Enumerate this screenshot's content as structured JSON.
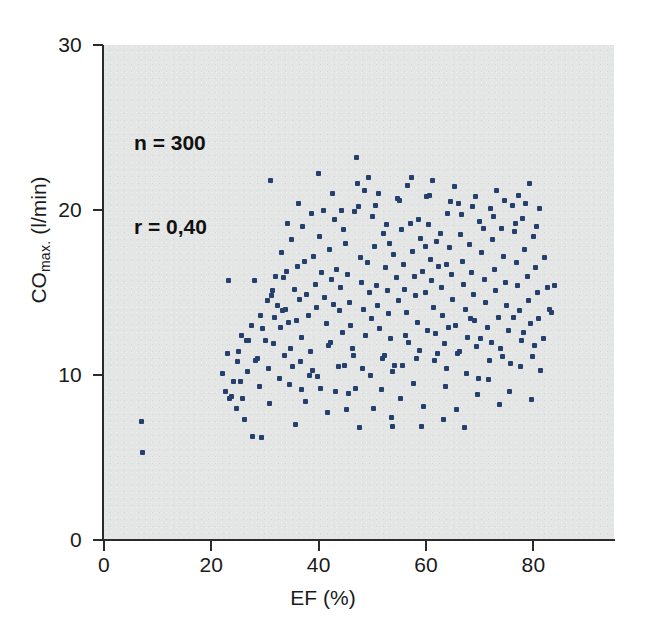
{
  "figure": {
    "background_color": "#ffffff",
    "plot_background_color": "#e3e6e5",
    "axis_color": "#2b2b2b",
    "marker_color": "#26406e"
  },
  "annotation": {
    "n_label": "n = 300",
    "r_label": "r = 0,40"
  },
  "chart_data": {
    "type": "scatter",
    "title": "",
    "xlabel": "EF (%)",
    "ylabel_main": "CO",
    "ylabel_sub": "max.",
    "ylabel_unit": " (l/min)",
    "ylabel_full": "CO max. (l/min)",
    "xlim": [
      0,
      95
    ],
    "ylim": [
      0,
      30
    ],
    "xticks": [
      0,
      20,
      40,
      60,
      80
    ],
    "xticklabels": [
      "0",
      "20",
      "40",
      "60",
      "80"
    ],
    "yticks": [
      0,
      10,
      20,
      30
    ],
    "yticklabels": [
      "0",
      "10",
      "20",
      "30"
    ],
    "grid": false,
    "legend": null,
    "annotations": [
      "n = 300",
      "r = 0,40"
    ],
    "n_points": 300,
    "correlation": 0.4,
    "marker": "square",
    "marker_size_px": 5,
    "points": [
      [
        7.0,
        7.2
      ],
      [
        7.2,
        5.3
      ],
      [
        22.0,
        10.1
      ],
      [
        22.6,
        9.0
      ],
      [
        23.0,
        11.3
      ],
      [
        23.4,
        8.6
      ],
      [
        23.8,
        8.7
      ],
      [
        24.2,
        9.6
      ],
      [
        24.6,
        8.0
      ],
      [
        25.0,
        11.4
      ],
      [
        25.4,
        9.6
      ],
      [
        25.8,
        8.6
      ],
      [
        26.2,
        7.3
      ],
      [
        26.6,
        12.1
      ],
      [
        27.0,
        12.1
      ],
      [
        27.6,
        6.3
      ],
      [
        28.0,
        15.7
      ],
      [
        23.2,
        15.7
      ],
      [
        28.6,
        11.0
      ],
      [
        29.0,
        9.3
      ],
      [
        29.4,
        6.2
      ],
      [
        30.0,
        12.1
      ],
      [
        30.4,
        14.5
      ],
      [
        30.8,
        8.3
      ],
      [
        31.0,
        21.8
      ],
      [
        31.4,
        15.1
      ],
      [
        31.8,
        13.5
      ],
      [
        32.0,
        16.0
      ],
      [
        32.4,
        14.2
      ],
      [
        32.8,
        12.9
      ],
      [
        33.0,
        17.4
      ],
      [
        33.4,
        15.9
      ],
      [
        33.8,
        14.0
      ],
      [
        34.0,
        16.3
      ],
      [
        34.4,
        13.2
      ],
      [
        34.8,
        11.6
      ],
      [
        35.0,
        18.2
      ],
      [
        35.4,
        15.2
      ],
      [
        35.8,
        13.3
      ],
      [
        36.0,
        16.6
      ],
      [
        36.4,
        14.6
      ],
      [
        36.8,
        12.3
      ],
      [
        37.0,
        19.0
      ],
      [
        37.4,
        16.9
      ],
      [
        37.8,
        14.9
      ],
      [
        38.0,
        13.6
      ],
      [
        38.4,
        11.4
      ],
      [
        38.8,
        10.3
      ],
      [
        39.0,
        17.2
      ],
      [
        39.4,
        15.5
      ],
      [
        39.6,
        14.1
      ],
      [
        40.0,
        22.2
      ],
      [
        40.2,
        18.4
      ],
      [
        40.6,
        16.2
      ],
      [
        41.0,
        14.7
      ],
      [
        41.4,
        13.1
      ],
      [
        41.8,
        11.8
      ],
      [
        42.0,
        17.6
      ],
      [
        42.4,
        15.8
      ],
      [
        42.8,
        14.3
      ],
      [
        43.0,
        19.4
      ],
      [
        43.4,
        16.4
      ],
      [
        43.8,
        13.9
      ],
      [
        44.0,
        15.3
      ],
      [
        44.4,
        12.6
      ],
      [
        44.8,
        10.6
      ],
      [
        45.0,
        18.0
      ],
      [
        45.4,
        16.1
      ],
      [
        45.8,
        14.4
      ],
      [
        46.0,
        13.0
      ],
      [
        46.4,
        11.2
      ],
      [
        46.8,
        9.2
      ],
      [
        47.0,
        23.2
      ],
      [
        47.4,
        20.2
      ],
      [
        47.8,
        17.1
      ],
      [
        48.0,
        15.6
      ],
      [
        48.4,
        14.0
      ],
      [
        48.8,
        12.4
      ],
      [
        49.0,
        16.8
      ],
      [
        49.4,
        15.0
      ],
      [
        49.8,
        13.4
      ],
      [
        50.0,
        19.6
      ],
      [
        50.4,
        17.8
      ],
      [
        50.8,
        15.4
      ],
      [
        51.0,
        14.2
      ],
      [
        51.4,
        12.8
      ],
      [
        51.8,
        11.0
      ],
      [
        52.0,
        18.6
      ],
      [
        52.4,
        16.5
      ],
      [
        52.8,
        15.1
      ],
      [
        53.0,
        13.7
      ],
      [
        53.4,
        12.2
      ],
      [
        53.8,
        10.2
      ],
      [
        54.0,
        17.3
      ],
      [
        54.4,
        15.9
      ],
      [
        54.8,
        14.5
      ],
      [
        55.0,
        20.6
      ],
      [
        55.4,
        18.8
      ],
      [
        55.8,
        16.7
      ],
      [
        56.0,
        15.2
      ],
      [
        56.4,
        13.8
      ],
      [
        56.8,
        12.0
      ],
      [
        57.0,
        19.2
      ],
      [
        57.4,
        17.5
      ],
      [
        57.8,
        16.0
      ],
      [
        58.0,
        14.8
      ],
      [
        58.4,
        13.2
      ],
      [
        58.8,
        11.5
      ],
      [
        59.0,
        18.3
      ],
      [
        59.4,
        16.3
      ],
      [
        59.8,
        15.0
      ],
      [
        60.0,
        20.8
      ],
      [
        60.4,
        19.1
      ],
      [
        60.8,
        17.0
      ],
      [
        61.0,
        15.7
      ],
      [
        61.4,
        14.1
      ],
      [
        61.8,
        12.5
      ],
      [
        62.0,
        18.1
      ],
      [
        62.4,
        16.6
      ],
      [
        62.8,
        15.3
      ],
      [
        63.0,
        13.6
      ],
      [
        63.4,
        11.9
      ],
      [
        63.8,
        10.4
      ],
      [
        64.0,
        19.8
      ],
      [
        64.4,
        17.7
      ],
      [
        64.8,
        16.1
      ],
      [
        65.0,
        14.6
      ],
      [
        65.4,
        13.0
      ],
      [
        65.8,
        11.3
      ],
      [
        66.0,
        20.4
      ],
      [
        66.4,
        18.5
      ],
      [
        66.8,
        16.9
      ],
      [
        67.0,
        15.5
      ],
      [
        67.4,
        14.0
      ],
      [
        67.8,
        12.3
      ],
      [
        68.0,
        17.9
      ],
      [
        68.4,
        16.2
      ],
      [
        68.8,
        14.9
      ],
      [
        69.0,
        13.3
      ],
      [
        69.4,
        11.7
      ],
      [
        69.8,
        9.8
      ],
      [
        70.0,
        19.3
      ],
      [
        70.4,
        17.4
      ],
      [
        70.8,
        15.8
      ],
      [
        71.0,
        14.4
      ],
      [
        71.4,
        12.9
      ],
      [
        71.8,
        10.9
      ],
      [
        72.0,
        20.1
      ],
      [
        72.4,
        18.2
      ],
      [
        72.8,
        16.4
      ],
      [
        73.0,
        15.1
      ],
      [
        73.4,
        13.5
      ],
      [
        73.8,
        11.6
      ],
      [
        74.0,
        18.9
      ],
      [
        74.4,
        17.2
      ],
      [
        74.8,
        15.6
      ],
      [
        75.0,
        14.2
      ],
      [
        75.4,
        12.7
      ],
      [
        75.8,
        10.7
      ],
      [
        76.0,
        20.3
      ],
      [
        76.4,
        18.7
      ],
      [
        76.8,
        16.8
      ],
      [
        77.0,
        15.4
      ],
      [
        77.4,
        13.9
      ],
      [
        77.8,
        12.1
      ],
      [
        78.0,
        19.5
      ],
      [
        78.4,
        17.6
      ],
      [
        78.8,
        16.0
      ],
      [
        79.0,
        14.5
      ],
      [
        79.4,
        13.1
      ],
      [
        79.8,
        11.1
      ],
      [
        80.0,
        18.4
      ],
      [
        80.4,
        16.5
      ],
      [
        80.8,
        15.0
      ],
      [
        81.0,
        13.4
      ],
      [
        81.4,
        10.3
      ],
      [
        82.0,
        17.1
      ],
      [
        82.6,
        15.3
      ],
      [
        83.0,
        14.0
      ],
      [
        84.0,
        15.4
      ],
      [
        34.6,
        9.4
      ],
      [
        35.6,
        7.0
      ],
      [
        36.6,
        10.8
      ],
      [
        37.6,
        8.4
      ],
      [
        39.8,
        9.9
      ],
      [
        41.6,
        7.7
      ],
      [
        43.6,
        10.5
      ],
      [
        45.6,
        8.9
      ],
      [
        47.6,
        6.8
      ],
      [
        49.6,
        10.0
      ],
      [
        51.6,
        9.1
      ],
      [
        53.6,
        7.4
      ],
      [
        55.6,
        10.6
      ],
      [
        57.6,
        9.5
      ],
      [
        59.6,
        8.1
      ],
      [
        61.6,
        10.9
      ],
      [
        63.6,
        9.3
      ],
      [
        65.6,
        7.9
      ],
      [
        67.6,
        10.1
      ],
      [
        69.6,
        8.8
      ],
      [
        71.6,
        9.7
      ],
      [
        73.6,
        8.2
      ],
      [
        75.6,
        9.0
      ],
      [
        77.6,
        10.5
      ],
      [
        79.6,
        8.5
      ],
      [
        30.6,
        10.4
      ],
      [
        32.6,
        9.8
      ],
      [
        28.2,
        10.9
      ],
      [
        26.8,
        10.2
      ],
      [
        24.8,
        10.8
      ],
      [
        38.6,
        19.8
      ],
      [
        40.8,
        20.0
      ],
      [
        42.6,
        21.0
      ],
      [
        44.6,
        18.8
      ],
      [
        46.6,
        19.9
      ],
      [
        48.6,
        21.2
      ],
      [
        50.6,
        20.3
      ],
      [
        52.6,
        19.1
      ],
      [
        54.6,
        20.7
      ],
      [
        56.6,
        21.5
      ],
      [
        58.6,
        19.4
      ],
      [
        60.6,
        20.9
      ],
      [
        62.6,
        18.6
      ],
      [
        64.6,
        20.5
      ],
      [
        66.6,
        19.7
      ],
      [
        68.6,
        20.2
      ],
      [
        70.6,
        18.9
      ],
      [
        72.6,
        19.6
      ],
      [
        74.6,
        20.6
      ],
      [
        76.6,
        19.2
      ],
      [
        78.6,
        20.4
      ],
      [
        80.6,
        19.0
      ],
      [
        36.2,
        20.4
      ],
      [
        34.2,
        19.2
      ],
      [
        33.6,
        11.2
      ],
      [
        31.6,
        11.9
      ],
      [
        29.6,
        12.8
      ],
      [
        27.4,
        13.0
      ],
      [
        25.6,
        12.4
      ],
      [
        43.2,
        9.0
      ],
      [
        45.2,
        7.9
      ],
      [
        59.2,
        6.9
      ],
      [
        63.2,
        7.3
      ],
      [
        50.2,
        8.0
      ],
      [
        55.2,
        8.6
      ],
      [
        66.2,
        11.4
      ],
      [
        70.2,
        12.2
      ],
      [
        74.2,
        11.1
      ],
      [
        78.2,
        12.6
      ],
      [
        81.8,
        12.2
      ],
      [
        83.4,
        13.8
      ],
      [
        40.4,
        9.2
      ],
      [
        36.8,
        9.1
      ],
      [
        33.2,
        13.9
      ],
      [
        31.2,
        14.8
      ],
      [
        29.2,
        13.6
      ],
      [
        44.2,
        20.0
      ],
      [
        49.2,
        22.0
      ],
      [
        47.2,
        21.6
      ],
      [
        51.2,
        21.0
      ],
      [
        53.2,
        18.0
      ],
      [
        57.2,
        22.0
      ],
      [
        61.2,
        21.8
      ],
      [
        65.2,
        21.4
      ],
      [
        69.2,
        20.8
      ],
      [
        73.2,
        21.2
      ],
      [
        77.2,
        20.9
      ],
      [
        79.2,
        21.6
      ],
      [
        81.2,
        20.1
      ],
      [
        42.2,
        12.0
      ],
      [
        46.2,
        11.6
      ],
      [
        52.2,
        11.2
      ],
      [
        54.2,
        10.6
      ],
      [
        56.2,
        12.4
      ],
      [
        58.2,
        11.0
      ],
      [
        60.2,
        12.7
      ],
      [
        62.2,
        11.3
      ],
      [
        64.2,
        12.9
      ],
      [
        68.2,
        13.4
      ],
      [
        72.2,
        12.0
      ],
      [
        76.2,
        13.5
      ],
      [
        80.2,
        11.8
      ],
      [
        67.2,
        6.8
      ],
      [
        53.8,
        6.9
      ],
      [
        48.2,
        10.4
      ],
      [
        38.2,
        10.0
      ],
      [
        35.2,
        10.5
      ],
      [
        59.8,
        17.8
      ],
      [
        63.8,
        16.7
      ]
    ]
  }
}
